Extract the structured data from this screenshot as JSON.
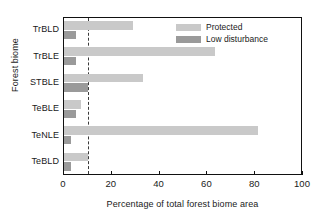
{
  "chart_data": {
    "type": "bar",
    "orientation": "horizontal",
    "title": "",
    "xlabel": "Percentage of total forest biome area",
    "ylabel": "Forest biome",
    "categories": [
      "TrBLD",
      "TrBLE",
      "STBLE",
      "TeBLE",
      "TeNLE",
      "TeBLD"
    ],
    "series": [
      {
        "name": "Protected",
        "color": "#c9c9c9",
        "values": [
          29,
          63,
          33,
          7,
          81,
          10
        ]
      },
      {
        "name": "Low disturbance",
        "color": "#9a9a9a",
        "values": [
          5,
          5,
          10,
          5,
          3,
          3
        ]
      }
    ],
    "xlim": [
      0,
      100
    ],
    "xticks": [
      0,
      20,
      40,
      60,
      80,
      100
    ],
    "xtick_labels": [
      "0",
      "20",
      "40",
      "60",
      "80",
      "100"
    ],
    "grid": false,
    "legend_position": "top-right",
    "annotations": [
      {
        "type": "reference-line",
        "name": "ten-percent-threshold",
        "orientation": "vertical",
        "value": 10,
        "style": "dashed",
        "color": "#3a3a3a"
      }
    ]
  },
  "legend": {
    "items": [
      {
        "label": "Protected"
      },
      {
        "label": "Low disturbance"
      }
    ]
  }
}
